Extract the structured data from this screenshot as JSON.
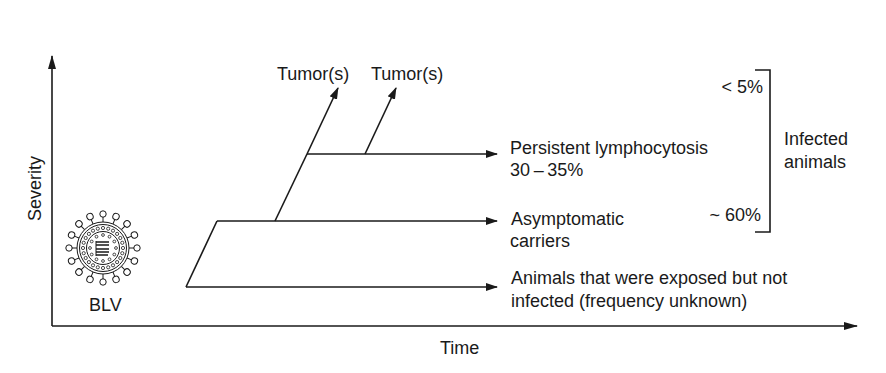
{
  "axes": {
    "y_label": "Severity",
    "x_label": "Time"
  },
  "virus": {
    "label": "BLV",
    "icon": "virus-particle-icon"
  },
  "branches": {
    "tumor_labels": [
      "Tumor(s)",
      "Tumor(s)"
    ],
    "persistent": {
      "line1": "Persistent lymphocytosis",
      "line2": "30 – 35%"
    },
    "asymptomatic": {
      "line1": "Asymptomatic",
      "line2": "carriers"
    },
    "exposed": {
      "line1": "Animals that were exposed but not",
      "line2": "infected (frequency unknown)"
    }
  },
  "bracket": {
    "top_value": "< 5%",
    "bottom_value": "~ 60%",
    "label_line1": "Infected",
    "label_line2": "animals"
  },
  "colors": {
    "ink": "#1a1a1a",
    "background": "#ffffff"
  }
}
